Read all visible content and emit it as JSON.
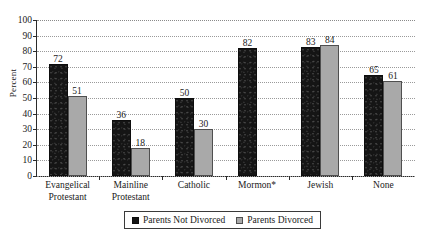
{
  "chart_data": {
    "type": "bar",
    "title": "",
    "subtitle": "",
    "xlabel": "",
    "ylabel": "Percent",
    "ylim": [
      0,
      100
    ],
    "ytick_step": 10,
    "yticks": [
      0,
      10,
      20,
      30,
      40,
      50,
      60,
      70,
      80,
      90,
      100
    ],
    "grid": "horizontal-dotted",
    "legend_position": "bottom-center",
    "categories": [
      "Evangelical Protestant",
      "Mainline Protestant",
      "Catholic",
      "Mormon*",
      "Jewish",
      "None"
    ],
    "category_lines": [
      [
        "Evangelical",
        "Protestant"
      ],
      [
        "Mainline",
        "Protestant"
      ],
      [
        "Catholic",
        ""
      ],
      [
        "Mormon*",
        ""
      ],
      [
        "Jewish",
        ""
      ],
      [
        "None",
        ""
      ]
    ],
    "series": [
      {
        "name": "Parents Not Divorced",
        "color": "#151515",
        "values": [
          72,
          36,
          50,
          82,
          83,
          65
        ],
        "labels": [
          "72",
          "36",
          "50",
          "82",
          "83",
          "65"
        ]
      },
      {
        "name": "Parents Divorced",
        "color": "#a9a9a9",
        "values": [
          51,
          18,
          30,
          null,
          84,
          61
        ],
        "labels": [
          "51",
          "18",
          "30",
          "",
          "84",
          "61"
        ]
      }
    ]
  },
  "axis": {
    "y_title": "Percent",
    "y_tick_labels": [
      "100",
      "90",
      "80",
      "70",
      "60",
      "50",
      "40",
      "30",
      "20",
      "10",
      "0"
    ]
  },
  "legend": {
    "entries": [
      {
        "label": "Parents Not Divorced",
        "swatch": "dark-square-icon"
      },
      {
        "label": "Parents Divorced",
        "swatch": "light-square-icon"
      }
    ]
  },
  "colors": {
    "series_dark": "#151515",
    "series_light": "#a9a9a9",
    "axis": "#2a2a2a",
    "gridline": "#9a9a9a",
    "background": "#ffffff"
  }
}
